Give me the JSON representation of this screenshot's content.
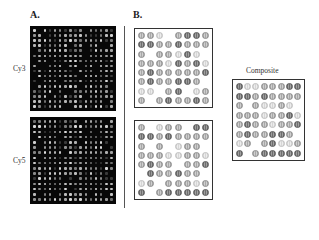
{
  "figure": {
    "panel_a": {
      "label": "A.",
      "arrays": [
        {
          "label": "Cy3",
          "rows": 16,
          "cols": 16
        },
        {
          "label": "Cy5",
          "rows": 16,
          "cols": 16
        }
      ]
    },
    "panel_b": {
      "label": "B.",
      "grids": {
        "top": [
          [
            2,
            2,
            1,
            0,
            2,
            3,
            3,
            2
          ],
          [
            3,
            3,
            2,
            2,
            3,
            2,
            2,
            2
          ],
          [
            2,
            0,
            2,
            2,
            1,
            3,
            1,
            0
          ],
          [
            2,
            2,
            2,
            1,
            3,
            2,
            3,
            1
          ],
          [
            2,
            3,
            2,
            2,
            2,
            2,
            2,
            3
          ],
          [
            2,
            3,
            2,
            2,
            3,
            3,
            2,
            0
          ],
          [
            1,
            1,
            0,
            2,
            3,
            0,
            1,
            2
          ],
          [
            2,
            0,
            2,
            3,
            2,
            2,
            3,
            2
          ]
        ],
        "bottom": [
          [
            2,
            0,
            1,
            2,
            2,
            0,
            3,
            3
          ],
          [
            3,
            3,
            2,
            3,
            2,
            2,
            2,
            2
          ],
          [
            2,
            0,
            2,
            0,
            1,
            2,
            2,
            0
          ],
          [
            2,
            2,
            2,
            1,
            1,
            2,
            2,
            1
          ],
          [
            2,
            3,
            2,
            2,
            0,
            2,
            2,
            3
          ],
          [
            0,
            3,
            2,
            2,
            3,
            2,
            2,
            0
          ],
          [
            1,
            2,
            0,
            2,
            2,
            2,
            1,
            2
          ],
          [
            3,
            0,
            2,
            3,
            3,
            3,
            3,
            3
          ]
        ],
        "composite": [
          [
            3,
            1,
            1,
            2,
            2,
            2,
            3,
            3
          ],
          [
            3,
            3,
            2,
            3,
            2,
            2,
            2,
            2
          ],
          [
            2,
            0,
            2,
            1,
            1,
            2,
            1,
            0
          ],
          [
            2,
            2,
            2,
            1,
            2,
            2,
            3,
            1
          ],
          [
            2,
            3,
            2,
            2,
            1,
            2,
            2,
            3
          ],
          [
            2,
            3,
            2,
            2,
            3,
            3,
            2,
            0
          ],
          [
            1,
            2,
            0,
            2,
            3,
            1,
            1,
            2
          ],
          [
            3,
            0,
            2,
            3,
            3,
            3,
            3,
            3
          ]
        ]
      },
      "composite_label": "Composite"
    }
  }
}
